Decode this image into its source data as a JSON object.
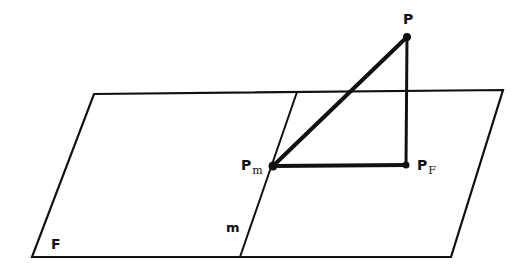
{
  "diagram": {
    "labels": {
      "P": "P",
      "Pm_main": "P",
      "Pm_sub": "m",
      "PF_main": "P",
      "PF_sub": "F",
      "F": "F",
      "m": "m"
    },
    "colors": {
      "line": "#111111",
      "background": "#ffffff"
    },
    "plane": {
      "corners": [
        [
          94,
          94
        ],
        [
          503,
          90
        ],
        [
          451,
          257
        ],
        [
          32,
          257
        ]
      ]
    },
    "line_m": {
      "top": [
        297,
        92
      ],
      "bottom": [
        240,
        257
      ]
    },
    "points": {
      "P": [
        407,
        37
      ],
      "Pm": [
        273,
        166
      ],
      "PF": [
        406,
        165
      ]
    }
  }
}
